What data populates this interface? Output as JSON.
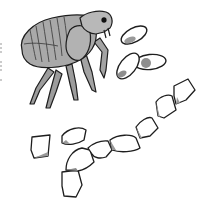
{
  "illustration": {
    "subject": "flea life cycle",
    "elements": [
      "adult flea",
      "eggs",
      "larva"
    ],
    "colors": {
      "body_fill": "#a9a9a9",
      "body_dark": "#7c7c7c",
      "outline": "#1e1e1e",
      "shade": "#9a9a9a",
      "background": "#ffffff"
    }
  }
}
